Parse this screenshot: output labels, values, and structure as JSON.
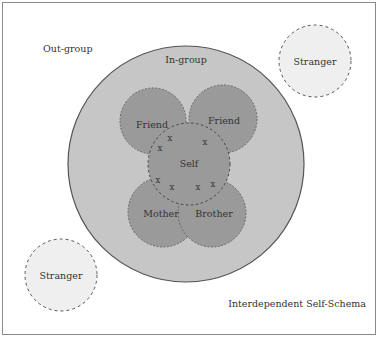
{
  "diagram": {
    "title": "Interdependent Self-Schema",
    "outgroup_label": "Out-group",
    "ingroup_label": "In-group",
    "self_label": "Self",
    "friend_left_label": "Friend",
    "friend_right_label": "Friend",
    "mother_label": "Mother",
    "brother_label": "Brother",
    "stranger_top_label": "Stranger",
    "stranger_bottom_label": "Stranger",
    "overlap_mark": "x",
    "colors": {
      "ingroup_fill": "#c6c6c6",
      "member_fill": "#9a9a9a",
      "stranger_fill": "#efefef",
      "dash_stroke": "#555555",
      "frame": "#8a8a8a"
    }
  }
}
